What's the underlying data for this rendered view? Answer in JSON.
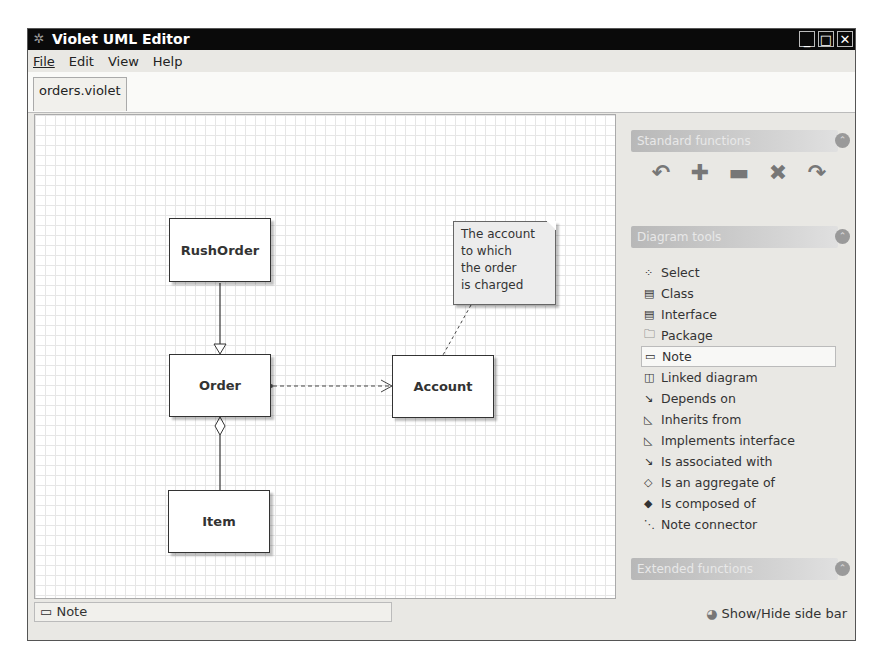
{
  "window": {
    "title": "Violet UML Editor",
    "controls": {
      "minimize": "_",
      "maximize": "□",
      "close": "✕"
    }
  },
  "menu": [
    "File",
    "Edit",
    "View",
    "Help"
  ],
  "tabs": [
    {
      "label": "orders.violet",
      "active": true
    }
  ],
  "diagram": {
    "classes": [
      {
        "name": "RushOrder"
      },
      {
        "name": "Order"
      },
      {
        "name": "Account"
      },
      {
        "name": "Item"
      }
    ],
    "note": {
      "lines": [
        "The account",
        "to which",
        "the order",
        "is charged"
      ]
    }
  },
  "sidebar": {
    "standard_header": "Standard functions",
    "standard_tools": [
      {
        "icon": "undo-icon",
        "glyph": "↶"
      },
      {
        "icon": "zoom-in-icon",
        "glyph": "✚"
      },
      {
        "icon": "zoom-out-icon",
        "glyph": "▬"
      },
      {
        "icon": "delete-icon",
        "glyph": "✖"
      },
      {
        "icon": "redo-icon",
        "glyph": "↷"
      }
    ],
    "diagram_header": "Diagram tools",
    "diagram_tools": [
      {
        "label": "Select",
        "glyph": "⁘"
      },
      {
        "label": "Class",
        "glyph": "▤"
      },
      {
        "label": "Interface",
        "glyph": "▤"
      },
      {
        "label": "Package",
        "glyph": "🗀"
      },
      {
        "label": "Note",
        "glyph": "▭",
        "selected": true
      },
      {
        "label": "Linked diagram",
        "glyph": "◫"
      },
      {
        "label": "Depends on",
        "glyph": "↘"
      },
      {
        "label": "Inherits from",
        "glyph": "◺"
      },
      {
        "label": "Implements interface",
        "glyph": "◺"
      },
      {
        "label": "Is associated with",
        "glyph": "↘"
      },
      {
        "label": "Is an aggregate of",
        "glyph": "◇"
      },
      {
        "label": "Is composed of",
        "glyph": "◆"
      },
      {
        "label": "Note connector",
        "glyph": "⋱"
      }
    ],
    "extended_header": "Extended functions",
    "collapse_glyph": "⌃",
    "show_hide": "Show/Hide side bar"
  },
  "status": {
    "current_tool": "Note",
    "glyph": "▭"
  }
}
